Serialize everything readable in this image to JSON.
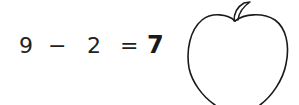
{
  "equation": {
    "operand1": "9",
    "operator": "−",
    "operand2": "2",
    "equals": "=",
    "answer": "7"
  },
  "illustration": {
    "icon": "apple-outline-icon",
    "stroke_color": "#1a1a1a"
  }
}
